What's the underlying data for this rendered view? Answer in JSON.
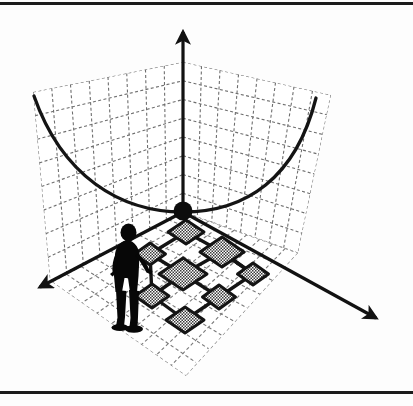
{
  "figure": {
    "domain": "diagram",
    "title": "",
    "caption": "",
    "background_color": "#fdfdfd",
    "ink_color": "#1b1b1b",
    "tile_fill_color": "#9a9a9a",
    "tile_edge_color": "#141414",
    "grid_color": "#6e6e6e",
    "figure_width": 413,
    "figure_height": 406
  },
  "page_rules": {
    "top_rule_label": "top page rule",
    "bottom_rule_label": "bottom page rule"
  },
  "axes": {
    "origin": {
      "x": 183,
      "y": 212
    },
    "vertical": {
      "name": "vertical-axis",
      "label": "",
      "tip": {
        "x": 183,
        "y": 25
      },
      "arrow": "up"
    },
    "left": {
      "name": "left-axis",
      "label": "",
      "tip": {
        "x": 33,
        "y": 292
      },
      "arrow": "down-left"
    },
    "right": {
      "name": "right-axis",
      "label": "",
      "tip": {
        "x": 382,
        "y": 322
      },
      "arrow": "down-right"
    }
  },
  "origin_marker": {
    "name": "origin-sphere",
    "label": "",
    "radius": 9,
    "color": "#101010"
  },
  "walls": {
    "left_wall": {
      "name": "left-wall-grid",
      "label": "",
      "corners": [
        {
          "x": 33,
          "y": 92
        },
        {
          "x": 183,
          "y": 62
        },
        {
          "x": 183,
          "y": 212
        },
        {
          "x": 50,
          "y": 281
        }
      ],
      "columns": 8,
      "rows": 8,
      "line_style": "dashed"
    },
    "right_wall": {
      "name": "right-wall-grid",
      "label": "",
      "corners": [
        {
          "x": 183,
          "y": 62
        },
        {
          "x": 331,
          "y": 95
        },
        {
          "x": 298,
          "y": 253
        },
        {
          "x": 183,
          "y": 212
        }
      ],
      "columns": 8,
      "rows": 8,
      "line_style": "dashed"
    }
  },
  "floor": {
    "name": "floor-grid",
    "label": "",
    "corners": [
      {
        "x": 183,
        "y": 212
      },
      {
        "x": 298,
        "y": 253
      },
      {
        "x": 186,
        "y": 376
      },
      {
        "x": 52,
        "y": 282
      }
    ],
    "columns": 9,
    "rows": 9,
    "line_style": "dashed"
  },
  "parabola": {
    "name": "objective-curve",
    "label": "",
    "description": "convex parabola drawn across both back walls meeting the origin",
    "left_end": {
      "x": 34,
      "y": 96
    },
    "vertex": {
      "x": 183,
      "y": 212
    },
    "right_end": {
      "x": 316,
      "y": 98
    },
    "stroke_width": 3
  },
  "person": {
    "name": "human-figure",
    "label": "",
    "position": {
      "x": 128,
      "y": 275
    },
    "height": 106,
    "color": "#070707"
  },
  "chart_data": {
    "type": "scatter",
    "title": "",
    "xlabel": "",
    "ylabel": "",
    "tiles": [
      {
        "id": "t1",
        "cx": 186,
        "cy": 232,
        "w": 36,
        "h": 24
      },
      {
        "id": "t2",
        "cx": 150,
        "cy": 254,
        "w": 31,
        "h": 22
      },
      {
        "id": "t3",
        "cx": 222,
        "cy": 252,
        "w": 44,
        "h": 30
      },
      {
        "id": "t4",
        "cx": 183,
        "cy": 274,
        "w": 48,
        "h": 32
      },
      {
        "id": "t5",
        "cx": 253,
        "cy": 274,
        "w": 31,
        "h": 22
      },
      {
        "id": "t6",
        "cx": 152,
        "cy": 296,
        "w": 34,
        "h": 24
      },
      {
        "id": "t7",
        "cx": 219,
        "cy": 297,
        "w": 33,
        "h": 24
      },
      {
        "id": "t8",
        "cx": 185,
        "cy": 320,
        "w": 38,
        "h": 26
      }
    ],
    "edges": [
      {
        "from": "t1",
        "to": "t2"
      },
      {
        "from": "t1",
        "to": "t3"
      },
      {
        "from": "t2",
        "to": "t4"
      },
      {
        "from": "t3",
        "to": "t4"
      },
      {
        "from": "t3",
        "to": "t5"
      },
      {
        "from": "t4",
        "to": "t6"
      },
      {
        "from": "t4",
        "to": "t7"
      },
      {
        "from": "t5",
        "to": "t7"
      },
      {
        "from": "t6",
        "to": "t8"
      },
      {
        "from": "t7",
        "to": "t8"
      },
      {
        "from": "t2",
        "to": "t6"
      },
      {
        "from": "t5",
        "to": "t3"
      }
    ]
  }
}
